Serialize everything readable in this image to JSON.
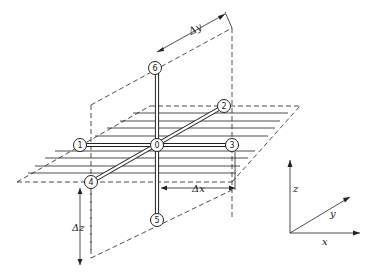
{
  "diagram": {
    "title": "",
    "nodes": [
      {
        "id": "0",
        "label": "0",
        "x": 157,
        "y": 145
      },
      {
        "id": "1",
        "label": "1",
        "x": 80,
        "y": 145
      },
      {
        "id": "2",
        "label": "2",
        "x": 224,
        "y": 106
      },
      {
        "id": "3",
        "label": "3",
        "x": 232,
        "y": 145
      },
      {
        "id": "4",
        "label": "4",
        "x": 91,
        "y": 182
      },
      {
        "id": "5",
        "label": "5",
        "x": 157,
        "y": 220
      },
      {
        "id": "6",
        "label": "6",
        "x": 155,
        "y": 68
      }
    ],
    "dimensions": {
      "dx": "Δx",
      "dy": "Δy",
      "dz": "Δz"
    },
    "axes": {
      "x": "x",
      "y": "y",
      "z": "z"
    }
  }
}
